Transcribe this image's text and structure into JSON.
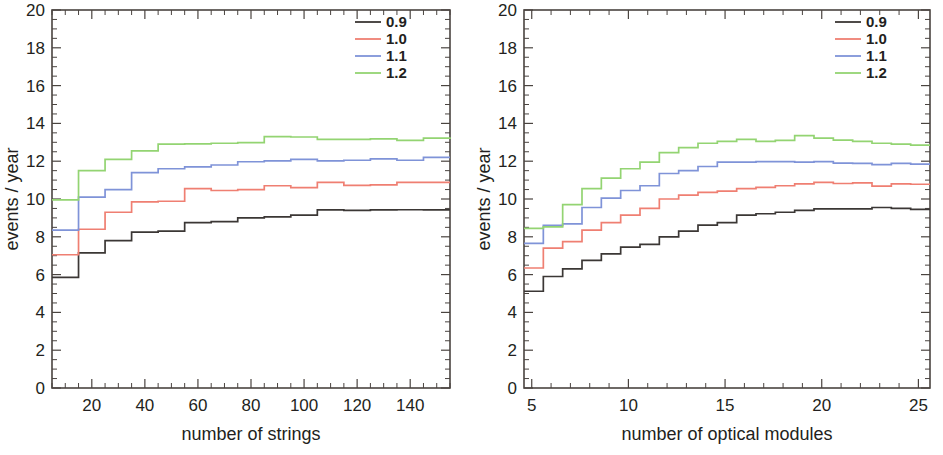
{
  "figure": {
    "background_color": "#ffffff",
    "panels": [
      "left",
      "right"
    ]
  },
  "series_colors": {
    "0.9": "#3b3735",
    "1.0": "#ef7f72",
    "1.1": "#7f93d8",
    "1.2": "#93d472"
  },
  "legend": {
    "entries": [
      {
        "label": "0.9",
        "color": "#3b3735"
      },
      {
        "label": "1.0",
        "color": "#ef7f72"
      },
      {
        "label": "1.1",
        "color": "#7f93d8"
      },
      {
        "label": "1.2",
        "color": "#93d472"
      }
    ]
  },
  "chart_data": [
    {
      "id": "left",
      "type": "line",
      "step": "post",
      "title": "",
      "xlabel": "number of strings",
      "ylabel": "events / year",
      "xlim": [
        5,
        155
      ],
      "ylim": [
        0,
        20
      ],
      "xticks": [
        20,
        40,
        60,
        80,
        100,
        120,
        140
      ],
      "xtick_labels": [
        "20",
        "40",
        "60",
        "80",
        "100",
        "120",
        "140"
      ],
      "xtick_minor_step": 5,
      "yticks": [
        0,
        2,
        4,
        6,
        8,
        10,
        12,
        14,
        16,
        18,
        20
      ],
      "ytick_labels": [
        "0",
        "2",
        "4",
        "6",
        "8",
        "10",
        "12",
        "14",
        "16",
        "18",
        "20"
      ],
      "ytick_minor_step": 0.5,
      "grid": false,
      "legend_position": "top-right",
      "x": [
        5,
        15,
        25,
        35,
        45,
        55,
        65,
        75,
        85,
        95,
        105,
        115,
        125,
        135,
        145,
        155
      ],
      "series": [
        {
          "name": "0.9",
          "color": "#3b3735",
          "values": [
            5.85,
            7.15,
            7.8,
            8.25,
            8.3,
            8.75,
            8.8,
            9.0,
            9.05,
            9.15,
            9.42,
            9.4,
            9.42,
            9.43,
            9.42,
            9.42
          ]
        },
        {
          "name": "1.0",
          "color": "#ef7f72",
          "values": [
            7.05,
            8.4,
            9.3,
            9.85,
            9.88,
            10.55,
            10.45,
            10.5,
            10.7,
            10.6,
            10.88,
            10.72,
            10.75,
            10.88,
            10.88,
            10.88
          ]
        },
        {
          "name": "1.1",
          "color": "#7f93d8",
          "values": [
            8.35,
            10.1,
            10.5,
            11.4,
            11.6,
            11.7,
            11.8,
            11.97,
            12.02,
            12.1,
            12.02,
            12.05,
            12.12,
            12.05,
            12.2,
            12.2
          ]
        },
        {
          "name": "1.2",
          "color": "#93d472",
          "values": [
            9.95,
            11.5,
            12.1,
            12.55,
            12.9,
            12.92,
            12.95,
            12.98,
            13.3,
            13.28,
            13.15,
            13.15,
            13.18,
            13.1,
            13.22,
            13.18
          ]
        }
      ]
    },
    {
      "id": "right",
      "type": "line",
      "step": "post",
      "title": "",
      "xlabel": "number of optical modules",
      "ylabel": "events / year",
      "xlim": [
        4.6,
        25.6
      ],
      "ylim": [
        0,
        20
      ],
      "xticks": [
        5,
        10,
        15,
        20,
        25
      ],
      "xtick_labels": [
        "5",
        "10",
        "15",
        "20",
        "25"
      ],
      "xtick_minor_step": 1,
      "yticks": [
        0,
        2,
        4,
        6,
        8,
        10,
        12,
        14,
        16,
        18,
        20
      ],
      "ytick_labels": [
        "0",
        "2",
        "4",
        "6",
        "8",
        "10",
        "12",
        "14",
        "16",
        "18",
        "20"
      ],
      "ytick_minor_step": 0.5,
      "grid": false,
      "legend_position": "top-right",
      "x": [
        4.6,
        5.6,
        6.6,
        7.6,
        8.6,
        9.6,
        10.6,
        11.6,
        12.6,
        13.6,
        14.6,
        15.6,
        16.6,
        17.6,
        18.6,
        19.6,
        20.6,
        21.6,
        22.6,
        23.6,
        24.6,
        25.6
      ],
      "series": [
        {
          "name": "0.9",
          "color": "#3b3735",
          "values": [
            5.12,
            5.9,
            6.3,
            6.75,
            7.1,
            7.45,
            7.6,
            8.0,
            8.3,
            8.62,
            8.75,
            9.15,
            9.22,
            9.3,
            9.4,
            9.48,
            9.48,
            9.48,
            9.55,
            9.5,
            9.45,
            9.45
          ]
        },
        {
          "name": "1.0",
          "color": "#ef7f72",
          "values": [
            6.35,
            7.4,
            7.75,
            8.35,
            8.75,
            9.15,
            9.5,
            10.0,
            10.2,
            10.35,
            10.42,
            10.55,
            10.62,
            10.7,
            10.8,
            10.88,
            10.82,
            10.85,
            10.68,
            10.8,
            10.78,
            10.78
          ]
        },
        {
          "name": "1.1",
          "color": "#7f93d8",
          "values": [
            7.65,
            8.6,
            8.68,
            9.55,
            10.05,
            10.45,
            10.7,
            11.35,
            11.5,
            11.72,
            11.95,
            11.95,
            11.98,
            11.98,
            11.95,
            11.98,
            11.9,
            11.88,
            11.82,
            11.88,
            11.85,
            11.85
          ]
        },
        {
          "name": "1.2",
          "color": "#93d472",
          "values": [
            8.45,
            8.52,
            9.7,
            10.55,
            11.1,
            11.6,
            11.95,
            12.45,
            12.72,
            12.95,
            13.05,
            13.15,
            13.05,
            13.1,
            13.35,
            13.22,
            13.12,
            13.05,
            12.95,
            12.9,
            12.85,
            12.85
          ]
        }
      ]
    }
  ]
}
